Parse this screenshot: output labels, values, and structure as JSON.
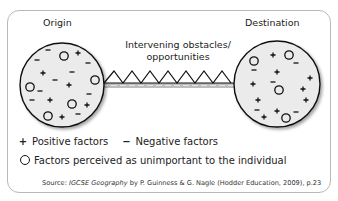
{
  "diagram": {
    "origin_label": "Origin",
    "destination_label": "Destination",
    "connector_label_line1": "Intervening obstacles/",
    "connector_label_line2": "opportunities",
    "origin_symbols": [
      {
        "t": "minus",
        "x": 48,
        "y": 50
      },
      {
        "t": "minus",
        "x": 37,
        "y": 60
      },
      {
        "t": "circle",
        "x": 64,
        "y": 56
      },
      {
        "t": "plus",
        "x": 78,
        "y": 53
      },
      {
        "t": "minus",
        "x": 88,
        "y": 63
      },
      {
        "t": "plus",
        "x": 43,
        "y": 73
      },
      {
        "t": "minus",
        "x": 72,
        "y": 72
      },
      {
        "t": "minus",
        "x": 55,
        "y": 80
      },
      {
        "t": "plus",
        "x": 69,
        "y": 85
      },
      {
        "t": "circle",
        "x": 30,
        "y": 87
      },
      {
        "t": "minus",
        "x": 40,
        "y": 91
      },
      {
        "t": "circle",
        "x": 95,
        "y": 80
      },
      {
        "t": "minus",
        "x": 89,
        "y": 94
      },
      {
        "t": "minus",
        "x": 32,
        "y": 100
      },
      {
        "t": "plus",
        "x": 50,
        "y": 100
      },
      {
        "t": "circle",
        "x": 72,
        "y": 104
      },
      {
        "t": "plus",
        "x": 87,
        "y": 105
      },
      {
        "t": "circle",
        "x": 48,
        "y": 116
      },
      {
        "t": "plus",
        "x": 62,
        "y": 117
      },
      {
        "t": "minus",
        "x": 78,
        "y": 114
      }
    ],
    "destination_symbols": [
      {
        "t": "circle",
        "x": 254,
        "y": 61
      },
      {
        "t": "minus",
        "x": 254,
        "y": 70
      },
      {
        "t": "plus",
        "x": 273,
        "y": 55
      },
      {
        "t": "circle",
        "x": 289,
        "y": 55
      },
      {
        "t": "minus",
        "x": 296,
        "y": 63
      },
      {
        "t": "plus",
        "x": 277,
        "y": 72
      },
      {
        "t": "plus",
        "x": 310,
        "y": 78
      },
      {
        "t": "minus",
        "x": 273,
        "y": 82
      },
      {
        "t": "plus",
        "x": 253,
        "y": 84
      },
      {
        "t": "circle",
        "x": 279,
        "y": 90
      },
      {
        "t": "plus",
        "x": 303,
        "y": 89
      },
      {
        "t": "plus",
        "x": 258,
        "y": 100
      },
      {
        "t": "plus",
        "x": 306,
        "y": 100
      },
      {
        "t": "minus",
        "x": 257,
        "y": 110
      },
      {
        "t": "plus",
        "x": 264,
        "y": 117
      },
      {
        "t": "plus",
        "x": 277,
        "y": 111
      },
      {
        "t": "circle",
        "x": 286,
        "y": 118
      },
      {
        "t": "minus",
        "x": 296,
        "y": 112
      }
    ]
  },
  "legend": {
    "plus_symbol": "+",
    "positive_label": "Positive factors",
    "minus_symbol": "−",
    "negative_label": "Negative factors",
    "circle_label": "Factors perceived as unimportant to the individual"
  },
  "source": {
    "prefix": "Source: ",
    "title": "IGCSE Geography",
    "suffix": " by P. Guinness & G. Nagle (Hodder Education, 2009), p.23"
  },
  "colors": {
    "circle_fill": "#ebebeb",
    "stroke": "#111111",
    "frame": "#b9b9b9",
    "bar": "#bdbdbd"
  }
}
